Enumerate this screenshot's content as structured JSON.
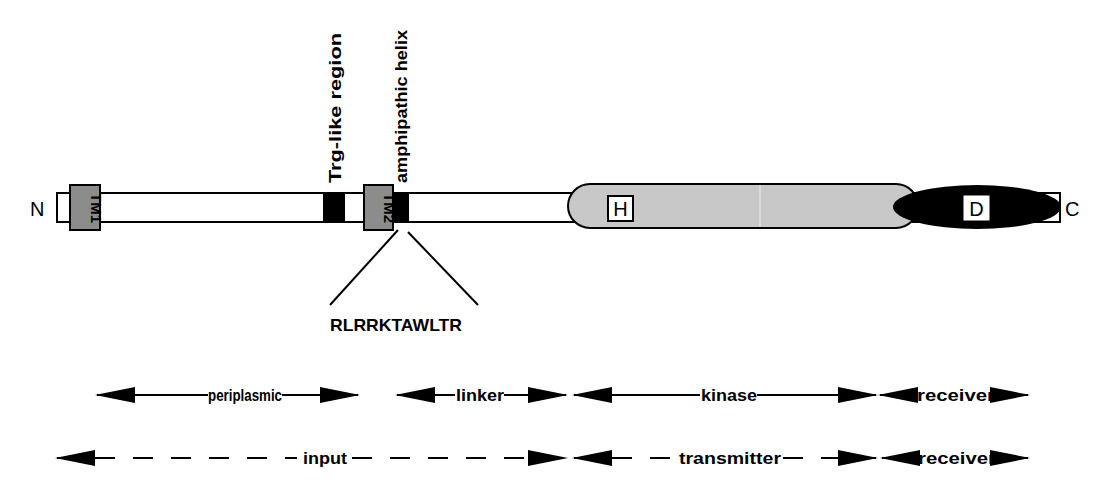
{
  "protein": {
    "n_terminus": "N",
    "c_terminus": "C",
    "tm1_label": "TM1",
    "tm2_label": "TM2",
    "trg_label": "Trg-like region",
    "amphipathic_label": "amphipathic helix",
    "sequence_label": "RLRRKTAWLTR",
    "h_box_label": "H",
    "d_box_label": "D"
  },
  "domain_row": {
    "periplasmic": "periplasmic",
    "linker": "linker",
    "kinase": "kinase",
    "receiver": "receiver"
  },
  "module_row": {
    "input": "input",
    "transmitter": "transmitter",
    "receiver": "receiver"
  },
  "colors": {
    "outline": "#000000",
    "tm_fill": "#8c8c8c",
    "kinase_fill": "#c8c8c8",
    "receiver_fill": "#000000",
    "motif_fill": "#000000"
  }
}
